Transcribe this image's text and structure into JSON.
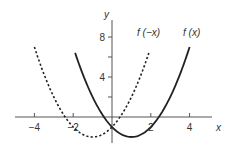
{
  "chart_data": {
    "type": "line",
    "title": "",
    "xlabel": "x",
    "ylabel": "y",
    "xlim": [
      -5.3,
      5.5
    ],
    "ylim": [
      -3.0,
      11.5
    ],
    "grid": false,
    "legend": "inline labels near curve ends",
    "x_ticks": [
      -4,
      -2,
      2,
      4
    ],
    "x_tick_labels": [
      "−4",
      "−2",
      "2",
      "4"
    ],
    "y_ticks": [
      2,
      4,
      6,
      8
    ],
    "y_tick_labels": [
      "",
      "4",
      "",
      "8"
    ],
    "series": [
      {
        "name": "f(x)",
        "label": "f (x)",
        "style": "solid",
        "formula": "x^2 - 2x - 1",
        "x_range": [
          -1.9,
          4
        ],
        "points": [
          [
            -1.9,
            7.41
          ],
          [
            -1,
            2
          ],
          [
            0,
            -1
          ],
          [
            1,
            -2
          ],
          [
            2,
            -1
          ],
          [
            3,
            2
          ],
          [
            4,
            7
          ]
        ]
      },
      {
        "name": "f(-x)",
        "label": "f (−x)",
        "style": "dashed",
        "formula": "x^2 + 2x - 1",
        "x_range": [
          -4,
          1.9
        ],
        "points": [
          [
            -4,
            7
          ],
          [
            -3,
            2
          ],
          [
            -2,
            -1
          ],
          [
            -1,
            -2
          ],
          [
            0,
            -1
          ],
          [
            1,
            2
          ],
          [
            1.9,
            7.41
          ]
        ]
      }
    ]
  },
  "axes": {
    "x_label": "x",
    "y_label": "y"
  }
}
